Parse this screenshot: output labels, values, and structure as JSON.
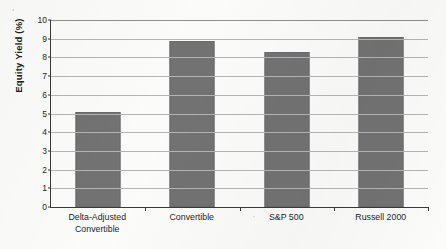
{
  "chart_data": {
    "type": "bar",
    "title": "",
    "xlabel": "",
    "ylabel": "Equity Yield (%)",
    "categories": [
      "Delta-Adjusted Convertible",
      "Convertible",
      "S&P 500",
      "Russell 2000"
    ],
    "category_lines": [
      [
        "Delta-Adjusted",
        "Convertible"
      ],
      [
        "Convertible"
      ],
      [
        "S&P 500"
      ],
      [
        "Russell 2000"
      ]
    ],
    "values": [
      5.1,
      8.9,
      8.3,
      9.1
    ],
    "ylim": [
      0,
      10
    ],
    "ytick_labels": [
      "10",
      "9",
      "8",
      "7",
      "6",
      "5",
      "4",
      "3",
      "2",
      "1",
      "0"
    ],
    "ytick_values": [
      10,
      9,
      8,
      7,
      6,
      5,
      4,
      3,
      2,
      1,
      0
    ],
    "grid": true,
    "legend": "none",
    "bar_color": "#727272",
    "gridline_color": "#b4b4b4",
    "axis_color": "#3a3a3a"
  }
}
